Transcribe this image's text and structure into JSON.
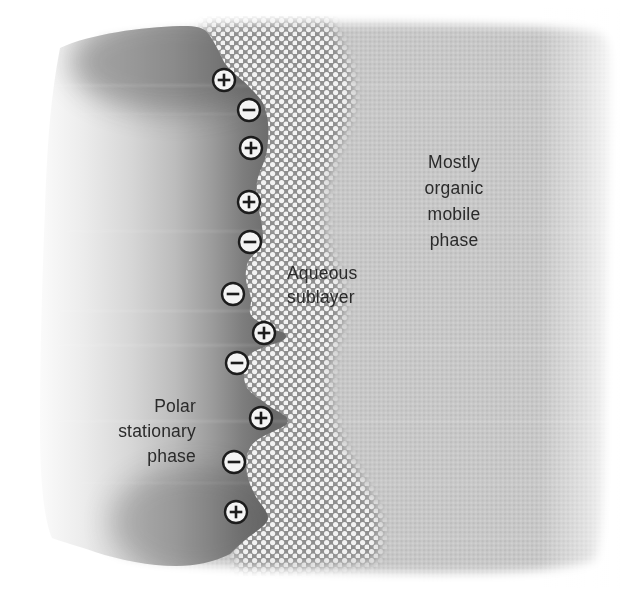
{
  "diagram": {
    "name": "polar-stationary-phase-aqueous-sublayer-organic-mobile-phase-interface",
    "labels": {
      "stationary": {
        "lines": [
          "Polar",
          "stationary",
          "phase"
        ],
        "x": 196,
        "y": 412,
        "anchor": "end",
        "line_height": 25
      },
      "aqueous": {
        "lines": [
          "Aqueous",
          "sublayer"
        ],
        "x": 287,
        "y": 279,
        "anchor": "start",
        "line_height": 24
      },
      "mobile": {
        "lines": [
          "Mostly",
          "organic",
          "mobile",
          "phase"
        ],
        "x": 454,
        "y": 168,
        "anchor": "middle",
        "line_height": 26
      }
    },
    "charges": [
      {
        "sign": "plus",
        "x": 224,
        "y": 80
      },
      {
        "sign": "minus",
        "x": 249,
        "y": 110
      },
      {
        "sign": "plus",
        "x": 251,
        "y": 148
      },
      {
        "sign": "plus",
        "x": 249,
        "y": 202
      },
      {
        "sign": "minus",
        "x": 250,
        "y": 242
      },
      {
        "sign": "minus",
        "x": 233,
        "y": 294
      },
      {
        "sign": "plus",
        "x": 264,
        "y": 333
      },
      {
        "sign": "minus",
        "x": 237,
        "y": 363
      },
      {
        "sign": "plus",
        "x": 261,
        "y": 418
      },
      {
        "sign": "minus",
        "x": 234,
        "y": 462
      },
      {
        "sign": "plus",
        "x": 236,
        "y": 512
      }
    ],
    "charge_style": {
      "radius": 11,
      "glyph_half_length": 6.3
    }
  },
  "colors": {
    "page_bg": "#ffffff",
    "ink": "#2a2a2a",
    "stationary_dark": "#6a6a6a",
    "stationary_light": "#fefefe",
    "aqueous_mesh": "#8f8f8f",
    "aqueous_dot": "#f3f3f3",
    "mobile_base": "#c8c8c8",
    "mobile_dot_dark": "#bcbcbc",
    "mobile_dot_light": "#d3d3d3",
    "charge_fill": "#f4f4f4",
    "charge_stroke": "#1c1c1c"
  }
}
